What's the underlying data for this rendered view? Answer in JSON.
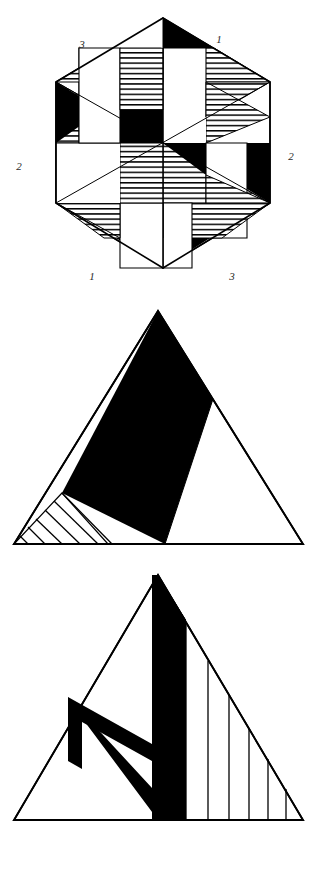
{
  "plate": {
    "background_color": "#ffffff",
    "ink_color": "#000000",
    "figure_count": 3
  },
  "figures": [
    {
      "id": "hexagon-pinwheel",
      "name": "Hexagonal pinwheel pattern",
      "shape": "hexagon",
      "labels": [
        {
          "text": "3",
          "x": 82,
          "y": 48,
          "corner": "top-left"
        },
        {
          "text": "1",
          "x": 219,
          "y": 43,
          "corner": "top-right"
        },
        {
          "text": "2",
          "x": 19,
          "y": 170,
          "corner": "left"
        },
        {
          "text": "2",
          "x": 291,
          "y": 160,
          "corner": "right"
        },
        {
          "text": "1",
          "x": 92,
          "y": 280,
          "corner": "bottom-left"
        },
        {
          "text": "3",
          "x": 232,
          "y": 280,
          "corner": "bottom-right"
        }
      ],
      "fills": [
        "solid-black",
        "horizontal-hatch",
        "white"
      ],
      "hatch_direction": "horizontal",
      "symmetry": "6-fold rotational",
      "vertices": [
        {
          "x": 163,
          "y": 18
        },
        {
          "x": 270,
          "y": 82
        },
        {
          "x": 270,
          "y": 203
        },
        {
          "x": 163,
          "y": 268
        },
        {
          "x": 56,
          "y": 203
        },
        {
          "x": 56,
          "y": 82
        }
      ]
    },
    {
      "id": "triangle-solid-wedge",
      "name": "Equilateral triangle with solid black wedge and hatched corner",
      "shape": "triangle",
      "fills": [
        "solid-black",
        "diagonal-hatch",
        "white"
      ],
      "hatch_direction": "diagonal",
      "hatch_line_count": 6,
      "vertices": [
        {
          "x": 158,
          "y": 311
        },
        {
          "x": 303,
          "y": 544
        },
        {
          "x": 14,
          "y": 544
        }
      ]
    },
    {
      "id": "triangle-vee-wedge",
      "name": "Equilateral triangle with black chevron and vertical hatching",
      "shape": "triangle",
      "fills": [
        "solid-black",
        "vertical-hatch",
        "white"
      ],
      "hatch_direction": "vertical",
      "hatch_line_count": 6,
      "vertices": [
        {
          "x": 158,
          "y": 575
        },
        {
          "x": 303,
          "y": 820
        },
        {
          "x": 14,
          "y": 820
        }
      ]
    }
  ]
}
